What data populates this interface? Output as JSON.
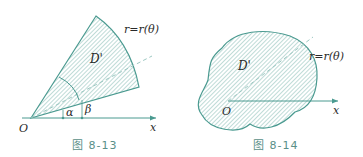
{
  "colors": {
    "line": "#4a9a90",
    "hatch": "#7fb8b0",
    "text": "#2a2a2a",
    "caption": "#5a8f88"
  },
  "figures": [
    {
      "caption": "图 8-13",
      "labels": {
        "region": "D'",
        "curve": "r=r(θ)",
        "origin": "O",
        "axis": "x",
        "alpha": "α",
        "beta": "β"
      }
    },
    {
      "caption": "图 8-14",
      "labels": {
        "region": "D'",
        "curve": "r=r(θ)",
        "origin": "O",
        "axis": "x"
      }
    }
  ]
}
